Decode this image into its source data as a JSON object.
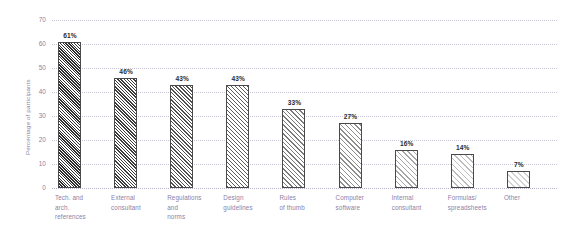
{
  "chart_data": {
    "type": "bar",
    "title": "",
    "subtitle": "",
    "xlabel": "",
    "ylabel": "Percentage of participants",
    "ylim": [
      0,
      70
    ],
    "ytick_values": [
      0,
      10,
      20,
      30,
      40,
      50,
      60,
      70
    ],
    "ytick_labels": [
      "0",
      "10",
      "20",
      "30",
      "40",
      "50",
      "60",
      "70"
    ],
    "grid": "horizontal-dotted",
    "legend": "none",
    "categories": [
      "Tech. and arch. references",
      "External consultant",
      "Regulations and norms",
      "Design guidelines",
      "Rules of thumb",
      "Computer software",
      "Internal consultant",
      "Formulas/ spreadsheets",
      "Other"
    ],
    "category_lines": [
      [
        "Tech. and",
        "arch.",
        "references"
      ],
      [
        "External",
        "consultant"
      ],
      [
        "Regulations",
        "and",
        "norms"
      ],
      [
        "Design",
        "guidelines"
      ],
      [
        "Rules",
        "of thumb"
      ],
      [
        "Computer",
        "software"
      ],
      [
        "Internal",
        "consultant"
      ],
      [
        "Formulas/",
        "spreadsheets"
      ],
      [
        "Other"
      ]
    ],
    "values": [
      61,
      46,
      43,
      43,
      33,
      27,
      16,
      14,
      7
    ],
    "data_labels": [
      "61%",
      "46%",
      "43%",
      "43%",
      "33%",
      "27%",
      "16%",
      "14%",
      "7%"
    ],
    "bar_fill_colors": [
      "#2e2e2e",
      "#3c3c3c",
      "#4f4f4f",
      "#5d5d5d",
      "#7a7a7a",
      "#8e8e8e",
      "#a6a6a6",
      "#bdbdbd",
      "#d2d2d2"
    ],
    "bar_edge_color": "#4a4a4a",
    "pattern": "diagonal-hatch"
  },
  "style": {
    "background": "#ffffff",
    "axis_label_color": "#8b7fa8",
    "value_label_color": "#2b2b2b",
    "gridline_color": "#c9c4d6"
  }
}
